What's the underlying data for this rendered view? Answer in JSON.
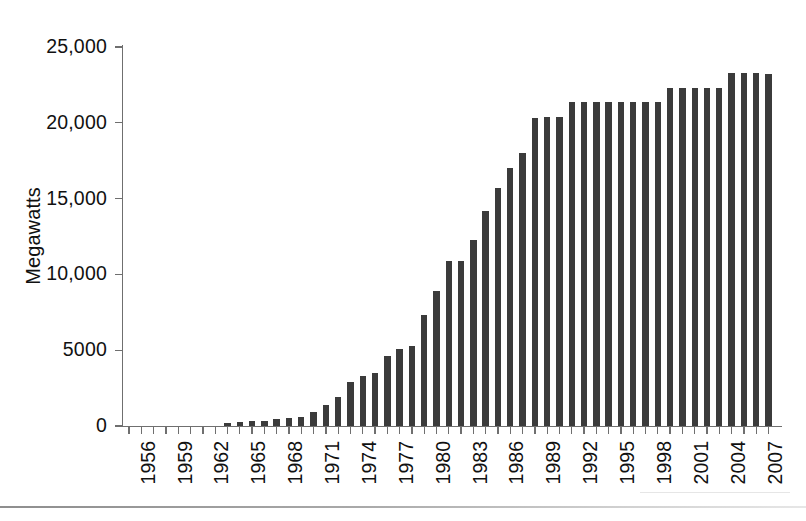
{
  "chart_data": {
    "type": "bar",
    "title": "",
    "subtitle": "",
    "xlabel": "",
    "ylabel": "Megawatts",
    "ylim": [
      0,
      25000
    ],
    "y_ticks": [
      0,
      5000,
      10000,
      15000,
      20000,
      25000
    ],
    "y_tick_labels": [
      "0",
      "5000",
      "10,000",
      "15,000",
      "20,000",
      "25,000"
    ],
    "grid": false,
    "legend": "none",
    "bar_color": "#3b3b3b",
    "axis_color": "#6f6f6f",
    "x_tick_label_rotation": -90,
    "x_tick_labels_shown_every": 3,
    "x_tick_labels": [
      "1956",
      "1959",
      "1962",
      "1965",
      "1968",
      "1971",
      "1974",
      "1977",
      "1980",
      "1983",
      "1986",
      "1989",
      "1992",
      "1995",
      "1998",
      "2001",
      "2004",
      "2007"
    ],
    "categories": [
      "1956",
      "1957",
      "1958",
      "1959",
      "1960",
      "1961",
      "1962",
      "1963",
      "1964",
      "1965",
      "1966",
      "1967",
      "1968",
      "1969",
      "1970",
      "1971",
      "1972",
      "1973",
      "1974",
      "1975",
      "1976",
      "1977",
      "1978",
      "1979",
      "1980",
      "1981",
      "1982",
      "1983",
      "1984",
      "1985",
      "1986",
      "1987",
      "1988",
      "1989",
      "1990",
      "1991",
      "1992",
      "1993",
      "1994",
      "1995",
      "1996",
      "1997",
      "1998",
      "1999",
      "2000",
      "2001",
      "2002",
      "2003",
      "2004",
      "2005",
      "2006",
      "2007",
      "2008"
    ],
    "values": [
      0,
      0,
      0,
      0,
      0,
      0,
      0,
      0,
      200,
      250,
      300,
      300,
      450,
      500,
      600,
      900,
      1400,
      1900,
      2900,
      3300,
      3500,
      4600,
      5100,
      5300,
      7300,
      8900,
      10900,
      10900,
      12300,
      14200,
      15700,
      17000,
      18000,
      20300,
      20400,
      20400,
      21400,
      21400,
      21400,
      21400,
      21400,
      21400,
      21400,
      21400,
      22300,
      22300,
      22300,
      22300,
      22300,
      23300,
      23300,
      23300,
      23200
    ]
  },
  "figure": {
    "background_color": "#ffffff",
    "width_px": 806,
    "height_px": 521
  }
}
